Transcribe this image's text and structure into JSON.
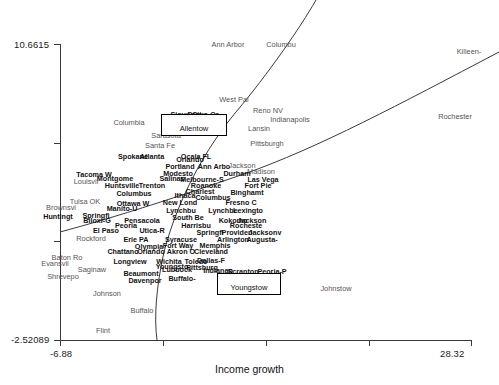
{
  "chart_data": {
    "type": "scatter",
    "title": "",
    "xlabel": "Income growth",
    "ylabel": "",
    "xlim": [
      -6.88,
      28.32
    ],
    "ylim": [
      -2.52089,
      10.6615
    ],
    "grid": false,
    "legend": "none",
    "axis": {
      "y_max_tick": "10.6615",
      "y_min_tick": "-2.52089",
      "x_min_tick": "-6.88",
      "x_max_tick": "28.32",
      "y_tick_count": 4,
      "x_tick_count": 5
    },
    "annotations": {
      "boxes": [
        {
          "label": "Allentow",
          "x": 194,
          "y": 125,
          "w": 66,
          "h": 22
        },
        {
          "label": "Youngstow",
          "x": 249,
          "y": 284,
          "w": 64,
          "h": 22
        }
      ],
      "curves": [
        {
          "name": "upper-steep-curve",
          "path": "M 316,0 C 300,28 268,74 236,112 C 206,148 178,198 164,252 C 156,288 154,318 157,340"
        },
        {
          "name": "lower-rising-curve",
          "path": "M 60,232 C 120,216 180,196 244,174 C 318,148 400,104 499,52"
        }
      ]
    },
    "points": [
      {
        "label": "Ann Arbor",
        "x": 228,
        "y": 45,
        "style": "sparse"
      },
      {
        "label": "Columbu",
        "x": 281,
        "y": 45,
        "style": "sparse"
      },
      {
        "label": "Killeen-",
        "x": 469,
        "y": 52,
        "style": "sparse"
      },
      {
        "label": "West Pal",
        "x": 234,
        "y": 100,
        "style": "sparse"
      },
      {
        "label": "Reno NV",
        "x": 268,
        "y": 111,
        "style": "sparse"
      },
      {
        "label": "Rochester",
        "x": 455,
        "y": 117,
        "style": "sparse"
      },
      {
        "label": "Indianapolis",
        "x": 290,
        "y": 120,
        "style": "sparse"
      },
      {
        "label": "Columbia",
        "x": 129,
        "y": 123,
        "style": "sparse"
      },
      {
        "label": "Sioux Cit",
        "x": 186,
        "y": 115,
        "style": "dense"
      },
      {
        "label": "Provo-Or",
        "x": 203,
        "y": 115,
        "style": "dense"
      },
      {
        "label": "Lansin",
        "x": 259,
        "y": 129,
        "style": "sparse"
      },
      {
        "label": "Sarasota",
        "x": 166,
        "y": 136,
        "style": "sparse"
      },
      {
        "label": "Pittsburgh",
        "x": 267,
        "y": 144,
        "style": "sparse"
      },
      {
        "label": "Santa Fe",
        "x": 160,
        "y": 146,
        "style": "sparse"
      },
      {
        "label": "Spokane",
        "x": 133,
        "y": 157,
        "style": "dense"
      },
      {
        "label": "Atlanta",
        "x": 152,
        "y": 157,
        "style": "dense"
      },
      {
        "label": "Ocala FL",
        "x": 196,
        "y": 157,
        "style": "dense"
      },
      {
        "label": "Orlando",
        "x": 190,
        "y": 160,
        "style": "dense"
      },
      {
        "label": "Jackson",
        "x": 242,
        "y": 166,
        "style": "sparse"
      },
      {
        "label": "Ann Arbo",
        "x": 214,
        "y": 167,
        "style": "dense"
      },
      {
        "label": "Portland",
        "x": 180,
        "y": 167,
        "style": "dense"
      },
      {
        "label": "Madison",
        "x": 261,
        "y": 172,
        "style": "sparse"
      },
      {
        "label": "Tacoma W",
        "x": 94,
        "y": 175,
        "style": "dense"
      },
      {
        "label": "Modesto",
        "x": 178,
        "y": 174,
        "style": "dense"
      },
      {
        "label": "Durham",
        "x": 237,
        "y": 174,
        "style": "dense"
      },
      {
        "label": "Montgome",
        "x": 115,
        "y": 179,
        "style": "dense"
      },
      {
        "label": "Salinas",
        "x": 172,
        "y": 179,
        "style": "dense"
      },
      {
        "label": "Melbourne-S",
        "x": 202,
        "y": 180,
        "style": "dense"
      },
      {
        "label": "Las Vega",
        "x": 263,
        "y": 180,
        "style": "dense"
      },
      {
        "label": "Louisvil",
        "x": 86,
        "y": 182,
        "style": "sparse"
      },
      {
        "label": "Huntsville",
        "x": 122,
        "y": 186,
        "style": "dense"
      },
      {
        "label": "Trenton",
        "x": 152,
        "y": 186,
        "style": "dense"
      },
      {
        "label": "Roanoke",
        "x": 206,
        "y": 186,
        "style": "dense"
      },
      {
        "label": "Fort Pie",
        "x": 258,
        "y": 186,
        "style": "dense"
      },
      {
        "label": "Columbus",
        "x": 134,
        "y": 194,
        "style": "dense"
      },
      {
        "label": "Charlest",
        "x": 200,
        "y": 192,
        "style": "dense"
      },
      {
        "label": "Binghamt",
        "x": 247,
        "y": 193,
        "style": "dense"
      },
      {
        "label": "Ithaca",
        "x": 185,
        "y": 196,
        "style": "dense"
      },
      {
        "label": "Columbus",
        "x": 213,
        "y": 198,
        "style": "dense"
      },
      {
        "label": "Tulsa OK",
        "x": 85,
        "y": 202,
        "style": "sparse"
      },
      {
        "label": "Ottawa W",
        "x": 133,
        "y": 204,
        "style": "dense"
      },
      {
        "label": "New Lond",
        "x": 180,
        "y": 203,
        "style": "dense"
      },
      {
        "label": "Fresno C",
        "x": 241,
        "y": 203,
        "style": "dense"
      },
      {
        "label": "Manito-U",
        "x": 122,
        "y": 209,
        "style": "dense"
      },
      {
        "label": "Brownsvi",
        "x": 61,
        "y": 208,
        "style": "sparse"
      },
      {
        "label": "Lynchbu",
        "x": 181,
        "y": 211,
        "style": "dense"
      },
      {
        "label": "Lynchbe",
        "x": 223,
        "y": 211,
        "style": "dense"
      },
      {
        "label": "Lexingto",
        "x": 248,
        "y": 211,
        "style": "dense"
      },
      {
        "label": "Springfi",
        "x": 96,
        "y": 216,
        "style": "dense"
      },
      {
        "label": "Huntingt",
        "x": 58,
        "y": 217,
        "style": "dense"
      },
      {
        "label": "South Be",
        "x": 188,
        "y": 218,
        "style": "dense"
      },
      {
        "label": "Pensacola",
        "x": 142,
        "y": 221,
        "style": "dense"
      },
      {
        "label": "Biloxi-G",
        "x": 97,
        "y": 221,
        "style": "dense"
      },
      {
        "label": "Kokomo",
        "x": 233,
        "y": 221,
        "style": "dense"
      },
      {
        "label": "Jackson",
        "x": 252,
        "y": 221,
        "style": "dense"
      },
      {
        "label": "Peoria",
        "x": 126,
        "y": 226,
        "style": "dense"
      },
      {
        "label": "Harrisbu",
        "x": 196,
        "y": 226,
        "style": "dense"
      },
      {
        "label": "Rocheste",
        "x": 246,
        "y": 226,
        "style": "dense"
      },
      {
        "label": "El Paso",
        "x": 106,
        "y": 231,
        "style": "dense"
      },
      {
        "label": "Utica-R",
        "x": 152,
        "y": 231,
        "style": "dense"
      },
      {
        "label": "Springfi",
        "x": 210,
        "y": 233,
        "style": "dense"
      },
      {
        "label": "Providen",
        "x": 237,
        "y": 233,
        "style": "dense"
      },
      {
        "label": "Jacksonv",
        "x": 265,
        "y": 233,
        "style": "dense"
      },
      {
        "label": "Rockford",
        "x": 91,
        "y": 239,
        "style": "sparse"
      },
      {
        "label": "Erie PA",
        "x": 136,
        "y": 240,
        "style": "dense"
      },
      {
        "label": "Syracuse",
        "x": 181,
        "y": 240,
        "style": "dense"
      },
      {
        "label": "Arlington",
        "x": 233,
        "y": 240,
        "style": "dense"
      },
      {
        "label": "Augusta-",
        "x": 262,
        "y": 240,
        "style": "dense"
      },
      {
        "label": "Fort Way",
        "x": 178,
        "y": 246,
        "style": "dense"
      },
      {
        "label": "Memphis",
        "x": 215,
        "y": 246,
        "style": "dense"
      },
      {
        "label": "Olympia",
        "x": 149,
        "y": 247,
        "style": "dense"
      },
      {
        "label": "Chattano",
        "x": 123,
        "y": 252,
        "style": "dense"
      },
      {
        "label": "Orlando",
        "x": 151,
        "y": 252,
        "style": "dense"
      },
      {
        "label": "Akron O",
        "x": 181,
        "y": 252,
        "style": "dense"
      },
      {
        "label": "Cleveland",
        "x": 211,
        "y": 252,
        "style": "dense"
      },
      {
        "label": "Baton Ro",
        "x": 67,
        "y": 258,
        "style": "sparse"
      },
      {
        "label": "Evansvil",
        "x": 55,
        "y": 264,
        "style": "sparse"
      },
      {
        "label": "Longview",
        "x": 130,
        "y": 262,
        "style": "dense"
      },
      {
        "label": "Wichita",
        "x": 169,
        "y": 262,
        "style": "dense"
      },
      {
        "label": "Toledo",
        "x": 196,
        "y": 262,
        "style": "dense"
      },
      {
        "label": "Dallas-F",
        "x": 211,
        "y": 261,
        "style": "dense"
      },
      {
        "label": "Youngsto",
        "x": 172,
        "y": 267,
        "style": "dense"
      },
      {
        "label": "Pittsburg",
        "x": 202,
        "y": 268,
        "style": "dense"
      },
      {
        "label": "Scranton",
        "x": 243,
        "y": 272,
        "style": "dense"
      },
      {
        "label": "Peoria-P",
        "x": 272,
        "y": 272,
        "style": "dense"
      },
      {
        "label": "Saginaw",
        "x": 92,
        "y": 270,
        "style": "sparse"
      },
      {
        "label": "Beaumont",
        "x": 141,
        "y": 274,
        "style": "dense"
      },
      {
        "label": "Lubbock",
        "x": 177,
        "y": 270,
        "style": "dense"
      },
      {
        "label": "Indianap",
        "x": 218,
        "y": 271,
        "style": "dense"
      },
      {
        "label": "Shrevepo",
        "x": 63,
        "y": 277,
        "style": "sparse"
      },
      {
        "label": "Davenpor",
        "x": 145,
        "y": 281,
        "style": "dense"
      },
      {
        "label": "Buffalo-",
        "x": 182,
        "y": 279,
        "style": "dense"
      },
      {
        "label": "Johnstow",
        "x": 336,
        "y": 289,
        "style": "sparse"
      },
      {
        "label": "Johnson",
        "x": 107,
        "y": 294,
        "style": "sparse"
      },
      {
        "label": "Buffalo",
        "x": 142,
        "y": 311,
        "style": "sparse"
      },
      {
        "label": "Flint",
        "x": 103,
        "y": 331,
        "style": "sparse"
      }
    ]
  }
}
